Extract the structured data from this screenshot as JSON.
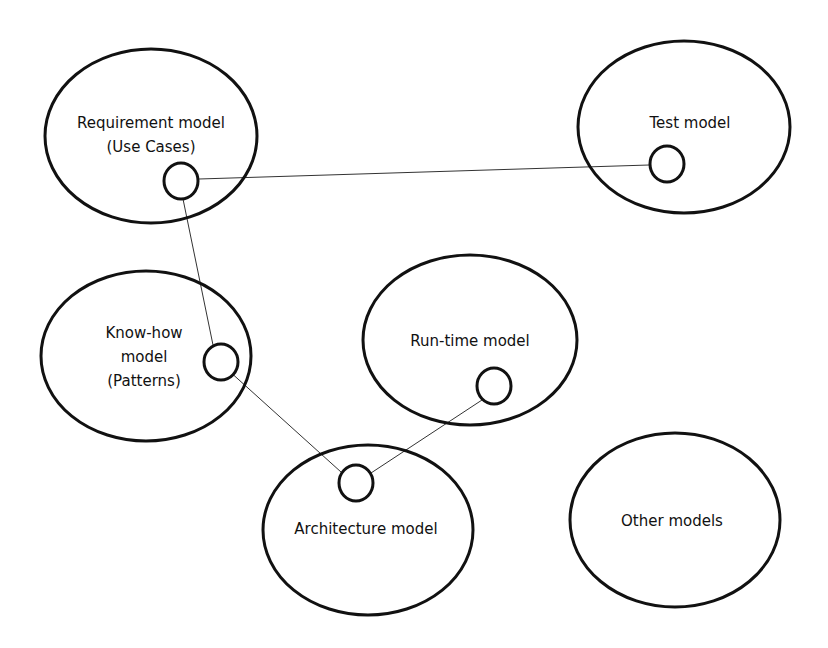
{
  "diagram": {
    "models": [
      {
        "id": "requirement",
        "lines": [
          "Requirement model",
          "(Use Cases)"
        ]
      },
      {
        "id": "test",
        "lines": [
          "Test model"
        ]
      },
      {
        "id": "knowhow",
        "lines": [
          "Know-how",
          "model",
          "(Patterns)"
        ]
      },
      {
        "id": "runtime",
        "lines": [
          "Run-time model"
        ]
      },
      {
        "id": "architecture",
        "lines": [
          "Architecture model"
        ]
      },
      {
        "id": "other",
        "lines": [
          "Other models"
        ]
      }
    ],
    "connections": [
      {
        "from": "requirement",
        "to": "test"
      },
      {
        "from": "requirement",
        "to": "knowhow"
      },
      {
        "from": "knowhow",
        "to": "architecture"
      },
      {
        "from": "runtime",
        "to": "architecture"
      }
    ]
  }
}
